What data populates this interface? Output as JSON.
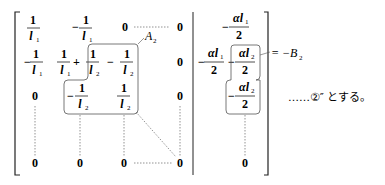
{
  "matrix": {
    "rows": [
      [
        "1/l1",
        "-1/l1",
        "0",
        "0",
        "-αl1/2"
      ],
      [
        "-1/l1",
        "1/l1 + 1/l2",
        "-1/l2",
        "0",
        "-αl1/2 - αl2/2"
      ],
      [
        "0",
        "-1/l2",
        "1/l2",
        "0",
        "-αl2/2"
      ],
      [
        "0",
        "0",
        "0",
        "0",
        "0"
      ]
    ],
    "zero": "0",
    "one": "1",
    "two": "2",
    "minus": "−",
    "plus": "+",
    "alpha": "α",
    "l": "l",
    "sub1": "1",
    "sub2": "2"
  },
  "labels": {
    "A": "A",
    "A_sub": "2",
    "B": "B",
    "B_sub": "2",
    "B_prefix": "= −",
    "equation_ref": "……②″ とする。"
  }
}
